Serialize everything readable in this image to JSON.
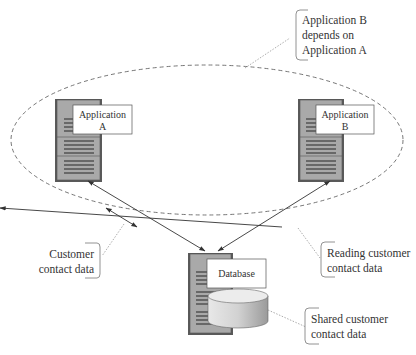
{
  "diagram": {
    "nodes": {
      "app_a": {
        "line1": "Application",
        "line2": "A"
      },
      "app_b": {
        "line1": "Application",
        "line2": "B"
      },
      "database": {
        "label": "Database"
      }
    },
    "callouts": {
      "dependency": {
        "lines": [
          "Application B",
          "depends on",
          "Application A"
        ]
      },
      "customer_contact": {
        "lines": [
          "Customer",
          "contact data"
        ]
      },
      "reading_contact": {
        "lines": [
          "Reading customer",
          "contact data"
        ]
      },
      "shared_contact": {
        "lines": [
          "Shared customer",
          "contact data"
        ]
      }
    },
    "edges": [
      {
        "from": "Application A",
        "to": "Database",
        "type": "bidirectional"
      },
      {
        "from": "Application B",
        "to": "Database",
        "type": "bidirectional"
      }
    ],
    "group": {
      "style": "dashed-ellipse",
      "contains": [
        "Application A",
        "Application B"
      ]
    },
    "colors": {
      "server_body": "#a9a9a9",
      "server_dark": "#5a5a5a",
      "server_lines": "#3f3f3f",
      "label_box_border": "#555555",
      "dashed": "#666666",
      "text": "#333333"
    }
  }
}
